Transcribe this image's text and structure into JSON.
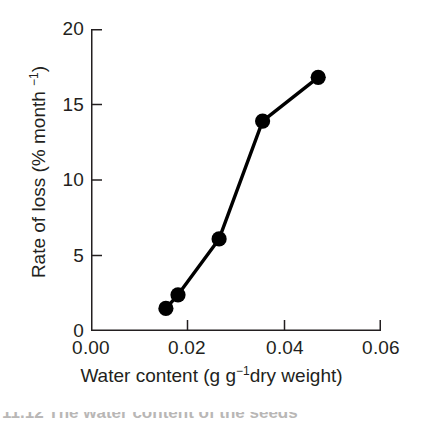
{
  "chart_data": {
    "type": "line",
    "title": "",
    "xlabel": "Water content (g g−1dry weight)",
    "ylabel": "Rate of loss (% month −1)",
    "xlabel_parts": {
      "pre": "Water content (g g",
      "sup": "−1",
      "post": "dry weight)"
    },
    "ylabel_parts": {
      "pre": "Rate of loss (% month ",
      "sup": "−1",
      "post": ")"
    },
    "xlim": [
      0.0,
      0.06
    ],
    "ylim": [
      0,
      20
    ],
    "xticks": [
      0.0,
      0.02,
      0.04,
      0.06
    ],
    "xtick_labels": [
      "0.00",
      "0.02",
      "0.04",
      "0.06"
    ],
    "yticks": [
      0,
      5,
      10,
      15,
      20
    ],
    "ytick_labels": [
      "0",
      "5",
      "10",
      "15",
      "20"
    ],
    "grid": false,
    "legend": false,
    "legend_position": "none",
    "marker": "filled-circle",
    "marker_color": "#000000",
    "line_color": "#000000",
    "x": [
      0.0155,
      0.018,
      0.0265,
      0.0355,
      0.047
    ],
    "y": [
      1.5,
      2.4,
      6.1,
      13.9,
      16.8
    ],
    "points": [
      {
        "x": 0.0155,
        "y": 1.5
      },
      {
        "x": 0.018,
        "y": 2.4
      },
      {
        "x": 0.0265,
        "y": 6.1
      },
      {
        "x": 0.0355,
        "y": 13.9
      },
      {
        "x": 0.047,
        "y": 16.8
      }
    ]
  },
  "figure": {
    "background": "#ffffff",
    "axis_color": "#231f20",
    "text_color": "#231f20",
    "caption_partial": "11.12   The water content of the seeds"
  }
}
